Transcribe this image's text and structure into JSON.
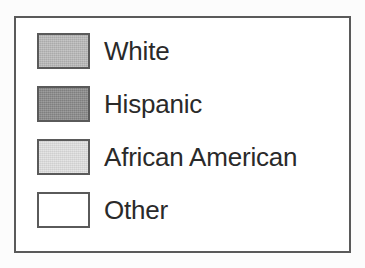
{
  "figure": {
    "kind": "map-legend",
    "background_color": "#fcfcfc",
    "box_background_color": "#ffffff",
    "box_border_color": "#5a5a5a",
    "label_color": "#2a2a2a",
    "swatch_border_color": "#5a5a5a"
  },
  "legend": {
    "entries": [
      {
        "label": "White",
        "swatch_color": "#b9b9b9",
        "textured": true
      },
      {
        "label": "Hispanic",
        "swatch_color": "#8a8a8a",
        "textured": true
      },
      {
        "label": "African American",
        "swatch_color": "#e0e0e0",
        "textured": true
      },
      {
        "label": "Other",
        "swatch_color": "#ffffff",
        "textured": false
      }
    ]
  },
  "chart_data": {
    "type": "table",
    "title": "",
    "subtitle": "",
    "xlabel": "",
    "ylabel": "",
    "legend_position": "standalone",
    "grid": false,
    "categories": [
      "White",
      "Hispanic",
      "African American",
      "Other"
    ],
    "series": [
      {
        "name": "Legend swatch fill",
        "values": [
          "#b9b9b9",
          "#8a8a8a",
          "#e0e0e0",
          "#ffffff"
        ]
      }
    ],
    "annotations": []
  }
}
